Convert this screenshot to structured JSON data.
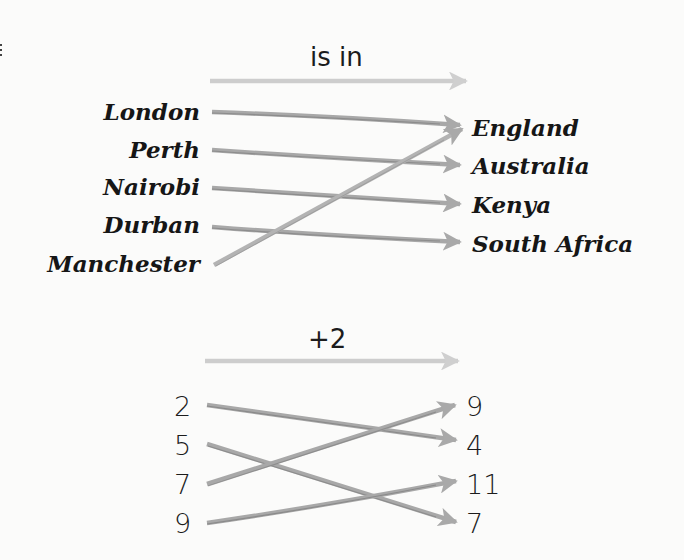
{
  "colors": {
    "background": "#fbfbfa",
    "text": "#161616",
    "arrow": "#ababab",
    "arrow_shade": "#7c7c7c",
    "relation_arrow": "#cdcdcd"
  },
  "diagram1": {
    "relation_label": "is in",
    "sources": [
      "London",
      "Perth",
      "Nairobi",
      "Durban",
      "Manchester"
    ],
    "targets": [
      "England",
      "Australia",
      "Kenya",
      "South Africa"
    ],
    "mappings": [
      {
        "from": "London",
        "to": "England"
      },
      {
        "from": "Perth",
        "to": "Australia"
      },
      {
        "from": "Nairobi",
        "to": "Kenya"
      },
      {
        "from": "Durban",
        "to": "South Africa"
      },
      {
        "from": "Manchester",
        "to": "England"
      }
    ]
  },
  "diagram2": {
    "relation_label": "+2",
    "sources": [
      "2",
      "5",
      "7",
      "9"
    ],
    "targets": [
      "9",
      "4",
      "11",
      "7"
    ],
    "mappings": [
      {
        "from": "2",
        "to": "4"
      },
      {
        "from": "5",
        "to": "7"
      },
      {
        "from": "7",
        "to": "9"
      },
      {
        "from": "9",
        "to": "11"
      }
    ]
  }
}
